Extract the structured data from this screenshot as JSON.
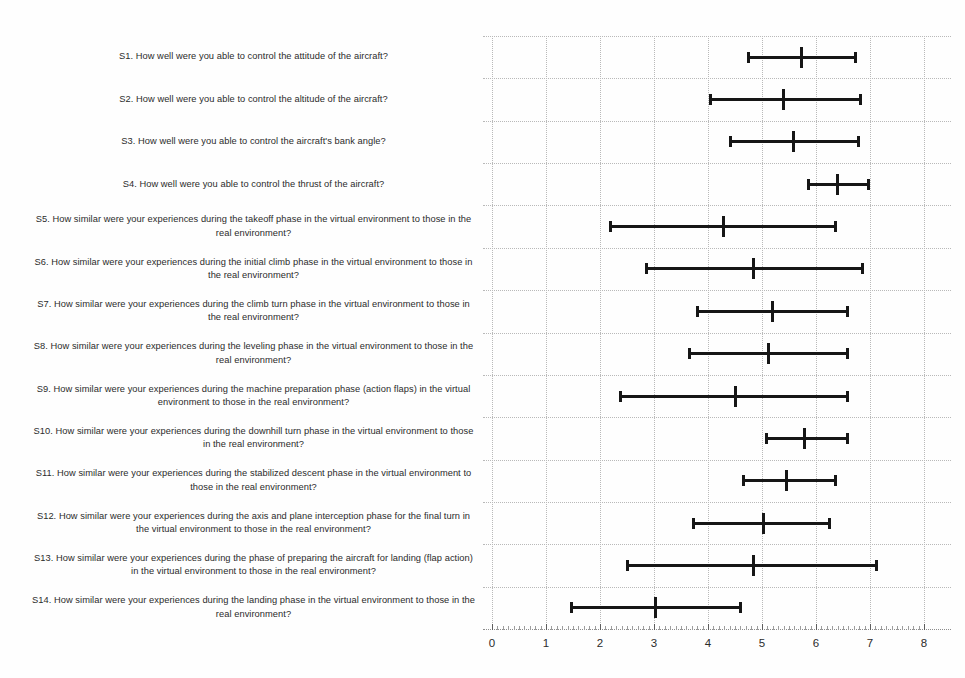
{
  "chart_data": {
    "type": "errorbar",
    "title": "",
    "xlabel": "",
    "ylabel": "",
    "xlim": [
      0,
      8
    ],
    "xticks": [
      "0",
      "1",
      "2",
      "3",
      "4",
      "5",
      "6",
      "7",
      "8"
    ],
    "grid": true,
    "legend": "none",
    "orientation": "horizontal",
    "categories": [
      "S1. How well were you able to control the attitude of the aircraft?",
      "S2. How well were you able to control the altitude of the aircraft?",
      "S3. How well were you able to control the aircraft's bank angle?",
      "S4. How well were you able to control the thrust of the aircraft?",
      "S5. How similar were your experiences during the takeoff phase in the virtual environment to those in the real environment?",
      "S6. How similar were your experiences during the initial climb phase in the virtual environment to those in the real environment?",
      "S7. How similar were your experiences during the climb turn phase in the virtual environment to those in the real environment?",
      "S8. How similar were your experiences during the leveling phase in the virtual environment to those in the real environment?",
      "S9. How similar were your experiences during the machine preparation phase (action flaps) in the virtual environment to those in the real environment?",
      "S10. How similar were your experiences during the downhill turn phase in the virtual environment to those in the real environment?",
      "S11. How similar were your experiences during the stabilized descent phase in the virtual environment to those in the real environment?",
      "S12. How similar were your experiences during the axis and plane interception phase for the final turn in the virtual environment to those in the real environment?",
      "S13. How similar were your experiences during the phase of preparing the aircraft for landing (flap action) in the virtual environment to those in the real environment?",
      "S14. How similar were your experiences during the landing phase in the virtual environment to those in the real environment?"
    ],
    "series": [
      {
        "name": "mean with error bars",
        "color": "#161616",
        "points": [
          {
            "id": "S1",
            "mean": 5.74,
            "low": 4.74,
            "high": 6.74
          },
          {
            "id": "S2",
            "mean": 5.4,
            "low": 4.04,
            "high": 6.83
          },
          {
            "id": "S3",
            "mean": 5.58,
            "low": 4.4,
            "high": 6.8
          },
          {
            "id": "S4",
            "mean": 6.4,
            "low": 5.85,
            "high": 6.98
          },
          {
            "id": "S5",
            "mean": 4.28,
            "low": 2.19,
            "high": 6.37
          },
          {
            "id": "S6",
            "mean": 4.85,
            "low": 2.85,
            "high": 6.87
          },
          {
            "id": "S7",
            "mean": 5.19,
            "low": 3.79,
            "high": 6.59
          },
          {
            "id": "S8",
            "mean": 5.12,
            "low": 3.65,
            "high": 6.59
          },
          {
            "id": "S9",
            "mean": 4.5,
            "low": 2.37,
            "high": 6.59
          },
          {
            "id": "S10",
            "mean": 5.79,
            "low": 5.07,
            "high": 6.59
          },
          {
            "id": "S11",
            "mean": 5.46,
            "low": 4.65,
            "high": 6.37
          },
          {
            "id": "S12",
            "mean": 5.02,
            "low": 3.72,
            "high": 6.26
          },
          {
            "id": "S13",
            "mean": 4.85,
            "low": 2.5,
            "high": 7.13
          },
          {
            "id": "S14",
            "mean": 3.02,
            "low": 1.46,
            "high": 4.61
          }
        ]
      }
    ]
  },
  "axis": {
    "tick_labels": [
      "0",
      "1",
      "2",
      "3",
      "4",
      "5",
      "6",
      "7",
      "8"
    ]
  },
  "colors": {
    "marker": "#161616",
    "grid": "#b9b9b9",
    "text": "#2b2b2b",
    "background": "#fefefe"
  }
}
